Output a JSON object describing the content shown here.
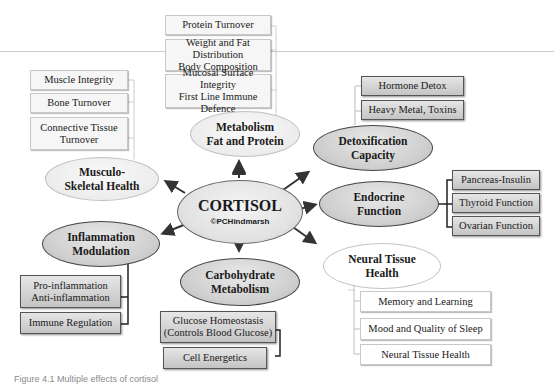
{
  "center": {
    "title": "CORTISOL",
    "credit": "©PCHindmarsh"
  },
  "nodes": {
    "metabolism": {
      "line1": "Metabolism",
      "line2": "Fat and Protein",
      "items": [
        {
          "line1": "Protein Turnover",
          "line2": ""
        },
        {
          "line1": "Weight and Fat Distribution",
          "line2": "Body Composition"
        },
        {
          "line1": "Mucosal Surface Integrity",
          "line2": "First Line Immune Defence"
        }
      ]
    },
    "musculoskeletal": {
      "line1": "Musculo-",
      "line2": "Skeletal Health",
      "items": [
        {
          "line1": "Muscle Integrity",
          "line2": ""
        },
        {
          "line1": "Bone Turnover",
          "line2": ""
        },
        {
          "line1": "Connective Tissue",
          "line2": "Turnover"
        }
      ]
    },
    "detox": {
      "line1": "Detoxification",
      "line2": "Capacity",
      "items": [
        {
          "line1": "Hormone Detox",
          "line2": ""
        },
        {
          "line1": "Heavy Metal, Toxins",
          "line2": ""
        }
      ]
    },
    "endocrine": {
      "line1": "Endocrine",
      "line2": "Function",
      "items": [
        {
          "line1": "Pancreas-Insulin",
          "line2": ""
        },
        {
          "line1": "Thyroid Function",
          "line2": ""
        },
        {
          "line1": "Ovarian Function",
          "line2": ""
        }
      ]
    },
    "inflammation": {
      "line1": "Inflammation",
      "line2": "Modulation",
      "items": [
        {
          "line1": "Pro-inflammation",
          "line2": "Anti-inflammation"
        },
        {
          "line1": "Immune Regulation",
          "line2": ""
        }
      ]
    },
    "carbohydrate": {
      "line1": "Carbohydrate",
      "line2": "Metabolism",
      "items": [
        {
          "line1": "Glucose Homeostasis",
          "line2": "(Controls Blood Glucose)"
        },
        {
          "line1": "Cell Energetics",
          "line2": ""
        }
      ]
    },
    "neural": {
      "line1": "Neural Tissue",
      "line2": "Health",
      "items": [
        {
          "line1": "Memory and Learning",
          "line2": ""
        },
        {
          "line1": "Mood and Quality of Sleep",
          "line2": ""
        },
        {
          "line1": "Neural Tissue Health",
          "line2": ""
        }
      ]
    }
  },
  "caption": "Figure 4.1 Multiple effects of cortisol"
}
